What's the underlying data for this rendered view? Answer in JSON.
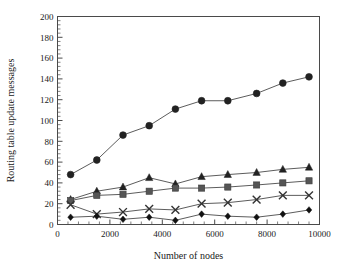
{
  "chart_data": {
    "type": "line",
    "title": "",
    "xlabel": "Number of nodes",
    "ylabel": "Routing table update messages",
    "xlim": [
      0,
      10000
    ],
    "ylim": [
      0,
      200
    ],
    "xticks": [
      0,
      2000,
      4000,
      6000,
      8000,
      10000
    ],
    "yticks": [
      0,
      20,
      40,
      60,
      80,
      100,
      120,
      140,
      160,
      180,
      200
    ],
    "xtick_labels": [
      "0",
      "2000",
      "4000",
      "6000",
      "8000",
      "10000"
    ],
    "ytick_labels": [
      "0",
      "20",
      "40",
      "60",
      "80",
      "100",
      "120",
      "140",
      "160",
      "180",
      "200"
    ],
    "x_minor_ticks": 4,
    "y_minor_ticks": 4,
    "grid": false,
    "legend": "none",
    "x": [
      500,
      1500,
      2500,
      3500,
      4500,
      5500,
      6500,
      7600,
      8600,
      9600
    ],
    "series": [
      {
        "name": "series-circle",
        "marker": "circle",
        "color": "#222222",
        "values": [
          48,
          62,
          86,
          95,
          111,
          119,
          119,
          126,
          136,
          142
        ]
      },
      {
        "name": "series-triangle",
        "marker": "triangle",
        "color": "#222222",
        "values": [
          24,
          32,
          36,
          45,
          39,
          46,
          48,
          50,
          53,
          55
        ]
      },
      {
        "name": "series-square",
        "marker": "square",
        "color": "#555555",
        "values": [
          23,
          28,
          29,
          32,
          35,
          35,
          36,
          38,
          40,
          42
        ]
      },
      {
        "name": "series-cross",
        "marker": "cross",
        "color": "#333333",
        "values": [
          19,
          10,
          12,
          15,
          14,
          20,
          21,
          24,
          28,
          28
        ]
      },
      {
        "name": "series-diamond",
        "marker": "diamond",
        "color": "#111111",
        "values": [
          7,
          8,
          5,
          7,
          4,
          10,
          8,
          7,
          10,
          14
        ]
      }
    ]
  },
  "axes": {
    "frame_color": "#4a4a4a",
    "line_color": "#555555"
  }
}
